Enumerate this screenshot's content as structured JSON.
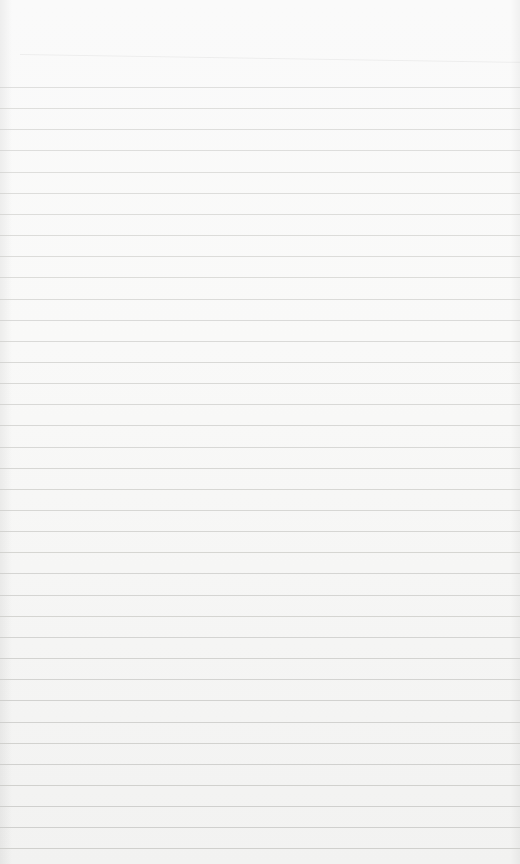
{
  "paper": {
    "background": "#f8f8f7",
    "line_color": "#c9c9c6",
    "line_count": 37,
    "first_line_y": 87,
    "line_spacing_px": 21.15
  }
}
